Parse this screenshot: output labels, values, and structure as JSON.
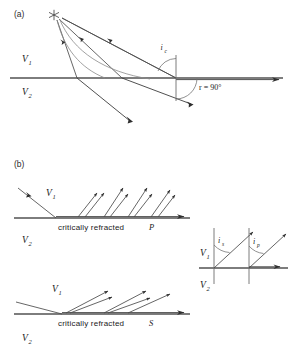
{
  "figure": {
    "panels": [
      {
        "id": "a",
        "label": "(a)",
        "upper_medium": "V",
        "upper_sub": "1",
        "lower_medium": "V",
        "lower_sub": "2",
        "source_icon": "star-source-icon",
        "critical_angle": "i",
        "critical_angle_sub": "c",
        "refraction_angle": "r = 90°"
      },
      {
        "id": "b",
        "label": "(b)",
        "p_panel": {
          "upper_medium": "V",
          "upper_sub": "1",
          "lower_medium": "V",
          "lower_sub": "2",
          "caption_text": "critically refracted",
          "caption_phase": "P"
        },
        "s_panel": {
          "upper_medium": "V",
          "upper_sub": "1",
          "lower_medium": "V",
          "lower_sub": "2",
          "caption_text": "critically refracted",
          "caption_phase": "S"
        },
        "inset": {
          "upper_medium": "V",
          "upper_sub": "1",
          "lower_medium": "V",
          "lower_sub": "2",
          "angle_s": "i",
          "angle_s_sub": "s",
          "angle_p": "i",
          "angle_p_sub": "p"
        }
      }
    ],
    "colors": {
      "interface": "#7d7d7d",
      "ray": "#4a4a4a",
      "wavefront": "#8a8a8a",
      "text": "#1a1a1a",
      "background": "#ffffff"
    }
  }
}
